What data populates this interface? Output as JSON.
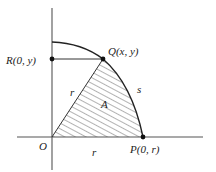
{
  "diagram": {
    "type": "geometry-sector",
    "colors": {
      "stroke": "#333333",
      "hatch": "#555555",
      "background": "#ffffff"
    },
    "points": {
      "origin": {
        "label": "O",
        "x": 52,
        "y": 137
      },
      "P": {
        "label": "P(0, r)",
        "x": 143,
        "y": 137
      },
      "Q": {
        "label": "Q(x, y)",
        "x": 103,
        "y": 59
      },
      "R": {
        "label": "R(0, y)",
        "x": 52,
        "y": 59
      }
    },
    "labels": {
      "radius_slanted": "r",
      "radius_horizontal": "r",
      "area": "A",
      "arc": "s"
    },
    "axes": {
      "x": {
        "x1": 17,
        "x2": 203,
        "y": 137
      },
      "y": {
        "x": 52,
        "y1": 8,
        "y2": 170
      }
    },
    "arc": {
      "start_x": 52,
      "start_y": 42
    }
  }
}
